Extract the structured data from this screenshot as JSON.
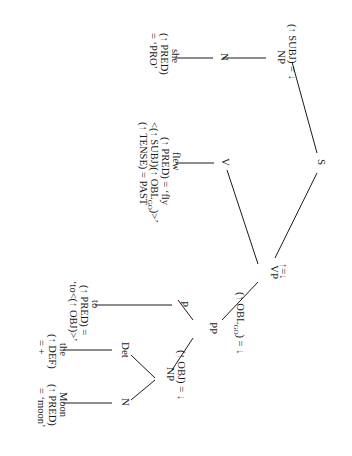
{
  "diagram": {
    "type": "LFG c-structure tree with f-structure annotations",
    "orientation": "rotated 90 degrees clockwise",
    "nodes": {
      "S": {
        "label": "S"
      },
      "NP_subj": {
        "label": "NP",
        "annotation": "(↑ SUBJ) = ↓"
      },
      "N_she": {
        "label": "N"
      },
      "V": {
        "label": "V"
      },
      "VP": {
        "label": "VP",
        "annotation": "↑=↓"
      },
      "PP": {
        "label": "PP",
        "annotation_pre": "(↑ OBL",
        "annotation_sub": "GO",
        "annotation_post": ") = ↓"
      },
      "P": {
        "label": "P"
      },
      "NP_obj": {
        "label": "NP",
        "annotation": "(↑ OBJ) = ↓"
      },
      "Det": {
        "label": "Det"
      },
      "N_moon": {
        "label": "N"
      }
    },
    "leaves": {
      "she": {
        "word": "she",
        "line1": "(↑ PRED)",
        "line2": "= ‘PRO’"
      },
      "flew": {
        "word": "flew",
        "line1": "(↑ PRED) = ‘fly",
        "line2_pre": "<(↑ SUBJ)(↑ OBL",
        "line2_sub": "GO",
        "line2_post": ")>’",
        "line3": "(↑ TENSE) = PAST"
      },
      "to": {
        "word": "to",
        "line1": "(↑ PRED) =",
        "line2": "‘to<(↑ OBJ)>’"
      },
      "the": {
        "word": "the",
        "line1": "(↑ DEF)",
        "line2": "= +"
      },
      "moon": {
        "word": "Moon",
        "line1": "(↑ PRED)",
        "line2": "= ‘moon’"
      }
    }
  }
}
